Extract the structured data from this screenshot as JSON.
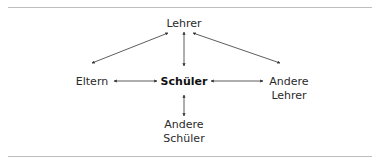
{
  "diagram": {
    "nodes": {
      "top": "Lehrer",
      "center": "Schüler",
      "left": "Eltern",
      "right_line1": "Andere",
      "right_line2": "Lehrer",
      "bottom_line1": "Andere",
      "bottom_line2": "Schüler"
    },
    "edges": [
      {
        "from": "Lehrer",
        "to": "Eltern",
        "type": "bidirectional"
      },
      {
        "from": "Lehrer",
        "to": "Schüler",
        "type": "bidirectional"
      },
      {
        "from": "Lehrer",
        "to": "Andere Lehrer",
        "type": "bidirectional"
      },
      {
        "from": "Eltern",
        "to": "Schüler",
        "type": "bidirectional"
      },
      {
        "from": "Schüler",
        "to": "Andere Lehrer",
        "type": "bidirectional"
      },
      {
        "from": "Schüler",
        "to": "Andere Schüler",
        "type": "bidirectional"
      }
    ],
    "colors": {
      "line": "#333333",
      "rule": "#bdbdbd"
    }
  }
}
